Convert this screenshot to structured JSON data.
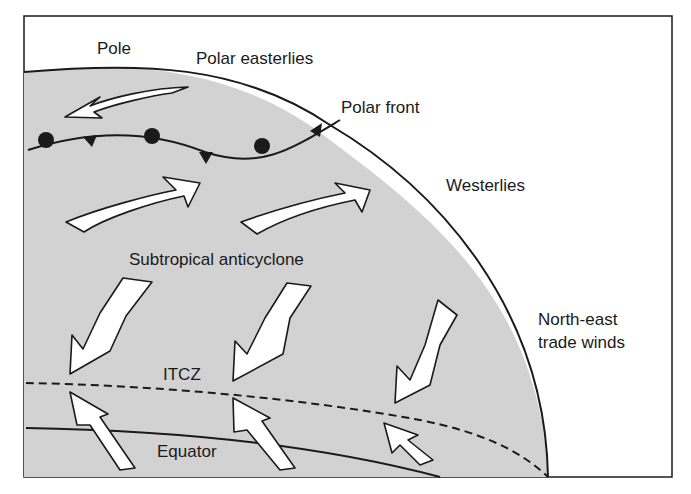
{
  "diagram": {
    "colors": {
      "background": "#ffffff",
      "globe_fill": "#d2d2d2",
      "line": "#1a1a1a",
      "arrow_fill": "#ffffff"
    },
    "labels": {
      "pole": "Pole",
      "polar_easterlies": "Polar easterlies",
      "polar_front": "Polar front",
      "westerlies": "Westerlies",
      "subtropical_anticyclone": "Subtropical anticyclone",
      "ne_trades_line1": "North-east",
      "ne_trades_line2": "trade winds",
      "itcz": "ITCZ",
      "equator": "Equator"
    },
    "arrows": [
      {
        "zone": "polar easterlies",
        "direction": "south-west"
      },
      {
        "zone": "westerlies",
        "direction": "north-east"
      },
      {
        "zone": "westerlies",
        "direction": "north-east"
      },
      {
        "zone": "north-east trades",
        "direction": "south-west"
      },
      {
        "zone": "north-east trades",
        "direction": "south-west"
      },
      {
        "zone": "north-east trades",
        "direction": "south-west"
      },
      {
        "zone": "south-east trades",
        "direction": "north-west"
      },
      {
        "zone": "south-east trades",
        "direction": "north-west"
      },
      {
        "zone": "south-east trades",
        "direction": "north-west"
      }
    ],
    "front_symbols": [
      "warm",
      "cold",
      "warm",
      "cold",
      "warm",
      "cold"
    ]
  }
}
